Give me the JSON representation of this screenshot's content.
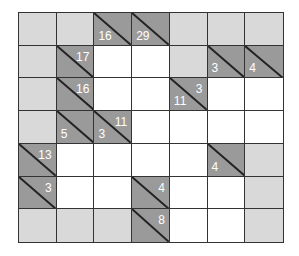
{
  "puzzle": {
    "type": "kakuro",
    "rows": 7,
    "cols": 7,
    "colors": {
      "blocked": "#d9d9d9",
      "clue": "#9a9a9a",
      "empty": "#ffffff",
      "line": "#333333",
      "clue_text": "#ffffff"
    },
    "grid": [
      [
        {
          "t": "b"
        },
        {
          "t": "b"
        },
        {
          "t": "c",
          "down": "16"
        },
        {
          "t": "c",
          "down": "29"
        },
        {
          "t": "b"
        },
        {
          "t": "b"
        },
        {
          "t": "b"
        }
      ],
      [
        {
          "t": "b"
        },
        {
          "t": "c",
          "across": "17"
        },
        {
          "t": "w"
        },
        {
          "t": "w"
        },
        {
          "t": "b"
        },
        {
          "t": "c",
          "down": "3"
        },
        {
          "t": "c",
          "down": "4"
        }
      ],
      [
        {
          "t": "b"
        },
        {
          "t": "c",
          "across": "16"
        },
        {
          "t": "w"
        },
        {
          "t": "w"
        },
        {
          "t": "c",
          "down": "11",
          "across": "3"
        },
        {
          "t": "w"
        },
        {
          "t": "w"
        }
      ],
      [
        {
          "t": "b"
        },
        {
          "t": "c",
          "down": "5"
        },
        {
          "t": "c",
          "down": "3",
          "across": "11"
        },
        {
          "t": "w"
        },
        {
          "t": "w"
        },
        {
          "t": "w"
        },
        {
          "t": "w"
        }
      ],
      [
        {
          "t": "c",
          "across": "13"
        },
        {
          "t": "w"
        },
        {
          "t": "w"
        },
        {
          "t": "w"
        },
        {
          "t": "w"
        },
        {
          "t": "c",
          "down": "4"
        },
        {
          "t": "b"
        }
      ],
      [
        {
          "t": "c",
          "across": "3"
        },
        {
          "t": "w"
        },
        {
          "t": "w"
        },
        {
          "t": "c",
          "across": "4"
        },
        {
          "t": "w"
        },
        {
          "t": "w"
        },
        {
          "t": "b"
        }
      ],
      [
        {
          "t": "b"
        },
        {
          "t": "b"
        },
        {
          "t": "b"
        },
        {
          "t": "c",
          "across": "8"
        },
        {
          "t": "w"
        },
        {
          "t": "w"
        },
        {
          "t": "b"
        }
      ]
    ]
  }
}
